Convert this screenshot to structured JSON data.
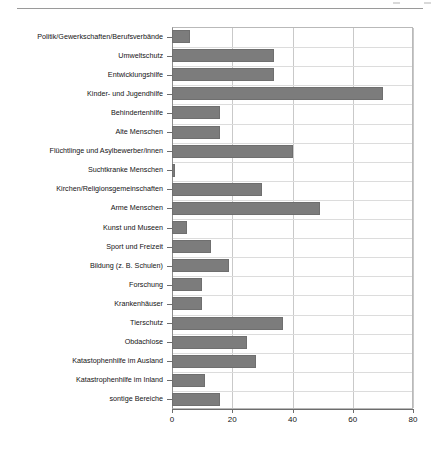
{
  "page": {
    "top_rule": true,
    "background_color": "#ffffff"
  },
  "chart_data": {
    "type": "bar",
    "orientation": "horizontal",
    "title": "",
    "subtitle": "",
    "xlabel": "",
    "ylabel": "",
    "xlim": [
      0,
      80
    ],
    "xticks": [
      0,
      20,
      40,
      60,
      80
    ],
    "xtick_labels": [
      "0",
      "20",
      "40",
      "60",
      "80"
    ],
    "grid": "vertical",
    "legend": "none",
    "bar_color": "#7c7c7c",
    "categories": [
      "Politik/Gewerkschaften/Berufsverbände",
      "Umweltschutz",
      "Entwicklungshilfe",
      "Kinder- und Jugendhilfe",
      "Behindertenhilfe",
      "Alte Menschen",
      "Flüchtlinge und Asylbewerber/innen",
      "Suchtkranke Menschen",
      "Kirchen/Religionsgemeinschaften",
      "Arme Menschen",
      "Kunst und Museen",
      "Sport und Freizeit",
      "Bildung (z. B. Schulen)",
      "Forschung",
      "Krankenhäuser",
      "Tierschutz",
      "Obdachlose",
      "Katastophenhilfe im Ausland",
      "Katastrophenhilfe im Inland",
      "sontige Bereiche"
    ],
    "values": [
      6,
      34,
      34,
      70,
      16,
      16,
      40,
      1,
      30,
      49,
      5,
      13,
      19,
      10,
      10,
      37,
      25,
      28,
      11,
      16
    ]
  }
}
